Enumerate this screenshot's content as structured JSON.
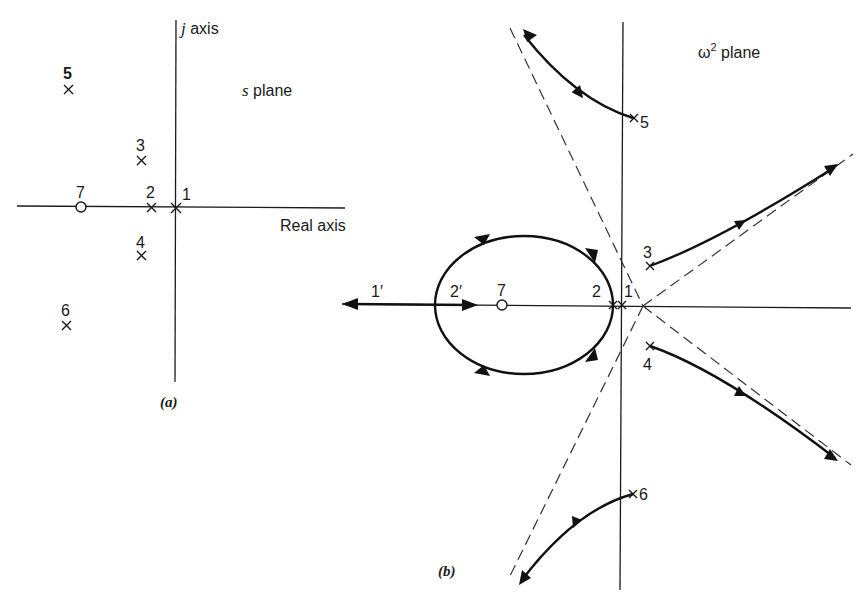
{
  "panel_a": {
    "caption": "(a)",
    "plane_label_var": "s",
    "plane_label_text": " plane",
    "vertical_axis_var": "j",
    "vertical_axis_text": " axis",
    "horizontal_axis_label": "Real axis",
    "poles": [
      {
        "id": "1",
        "label": "1"
      },
      {
        "id": "2",
        "label": "2"
      },
      {
        "id": "3",
        "label": "3"
      },
      {
        "id": "4",
        "label": "4"
      },
      {
        "id": "5",
        "label": "5"
      },
      {
        "id": "6",
        "label": "6"
      }
    ],
    "zeros": [
      {
        "id": "7",
        "label": "7"
      }
    ]
  },
  "panel_b": {
    "caption": "(b)",
    "plane_label_var": "ω",
    "plane_label_sup": "2",
    "plane_label_text": " plane",
    "poles": [
      {
        "id": "1",
        "label": "1"
      },
      {
        "id": "2",
        "label": "2"
      },
      {
        "id": "3",
        "label": "3"
      },
      {
        "id": "4",
        "label": "4"
      },
      {
        "id": "5",
        "label": "5"
      },
      {
        "id": "6",
        "label": "6"
      }
    ],
    "zeros": [
      {
        "id": "7",
        "label": "7"
      }
    ],
    "breakaway_labels": [
      {
        "id": "1prime",
        "label": "1′"
      },
      {
        "id": "2prime",
        "label": "2′"
      }
    ]
  },
  "colors": {
    "ink": "#1a1a1a",
    "background": "#ffffff"
  }
}
